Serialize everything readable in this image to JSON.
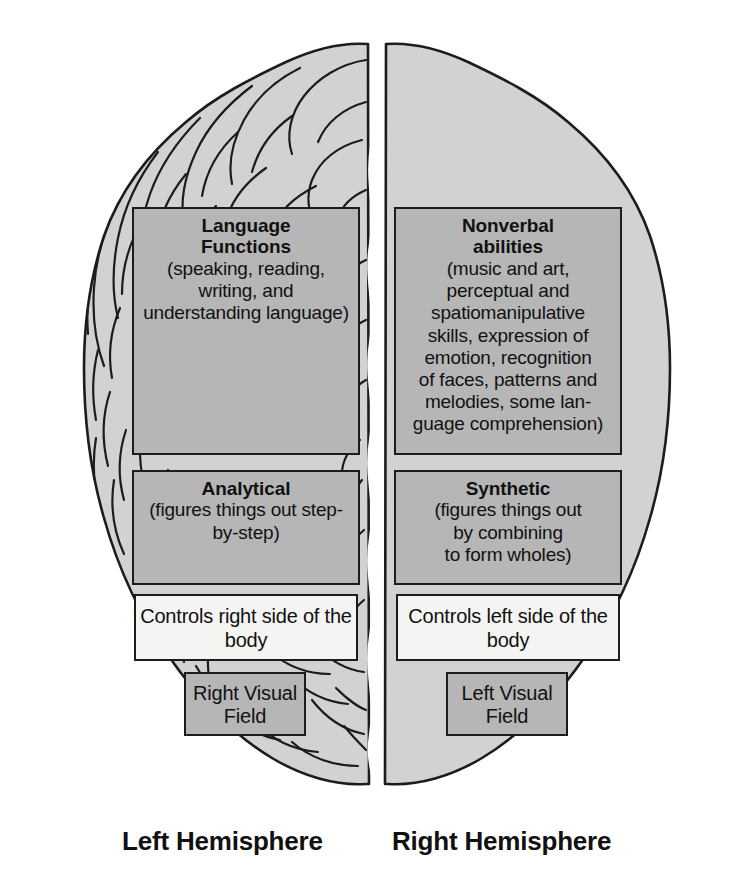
{
  "figure": {
    "name": "brain-hemispheres-functions-diagram",
    "view": "superior (top-down) view of the cerebrum split by the longitudinal fissure",
    "colors": {
      "brain_fill": "#d2d2d2",
      "box_fill_gray": "#b6b6b6",
      "box_fill_white": "#f4f4f2",
      "outline": "#1c1c1c",
      "text": "#111111",
      "background": "#ffffff"
    }
  },
  "left_hemisphere": {
    "caption": "Left Hemisphere",
    "boxes": {
      "language": {
        "title": "Language\nFunctions",
        "title_line1": "Language",
        "title_line2": "Functions",
        "body": "(speaking, reading, writing, and understanding language)",
        "fill": "gray"
      },
      "analytical": {
        "title": "Analytical",
        "body": "(figures things out step-by-step)",
        "fill": "gray"
      },
      "controls": {
        "body": "Controls right side of the body",
        "fill": "white"
      },
      "visual_field": {
        "body": "Right Visual Field",
        "fill": "gray"
      }
    }
  },
  "right_hemisphere": {
    "caption": "Right Hemisphere",
    "boxes": {
      "nonverbal": {
        "title_line1": "Nonverbal",
        "title_line2": "abilities",
        "body": "(music and art, perceptual and spatiomanipulative skills, expression of emotion, recognition of faces, patterns and melodies, some lan-guage comprehension)",
        "body_lines": [
          "(music and art,",
          "perceptual and",
          "spatiomanipulative",
          "skills, expression of",
          "emotion, recognition",
          "of faces, patterns and",
          "melodies, some lan-",
          "guage comprehension)"
        ],
        "fill": "gray"
      },
      "synthetic": {
        "title": "Synthetic",
        "body": "(figures things out by combining to form wholes)",
        "body_lines": [
          "(figures things out",
          "by combining",
          "to form wholes)"
        ],
        "fill": "gray"
      },
      "controls": {
        "body": "Controls left side of the body",
        "fill": "white"
      },
      "visual_field": {
        "body": "Left Visual Field",
        "fill": "gray"
      }
    }
  }
}
